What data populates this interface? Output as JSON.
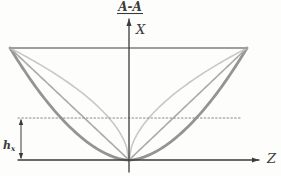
{
  "section_title": "A-A",
  "axis": {
    "vertical_label": "X",
    "horizontal_label": "Z"
  },
  "dimension": {
    "base": "h",
    "subscript": "x"
  },
  "colors": {
    "ink": "#3b3b3b",
    "outer_curve": "#949494",
    "straight_line": "#aaaaaa",
    "inner_curve": "#c8c8c8",
    "top_edge": "#9e9e9e",
    "dotted_line": "#8c8c8c",
    "background": "#fdfdfc"
  },
  "chart_data": {
    "type": "line",
    "origin_px": [
      129,
      160
    ],
    "top_edge_y_px": 48,
    "left_corner_x_px": 10,
    "right_corner_x_px": 247,
    "dotted_level_y_px": 118,
    "dotted_extent_x_px": [
      18,
      240
    ],
    "dimension_line_x_px": 21,
    "x_axis": {
      "x_px": 129,
      "top_y_px": 19,
      "bottom_y_px": 172
    },
    "z_axis": {
      "y_px": 160,
      "left_x_px": 18,
      "right_x_px": 259
    },
    "curves": [
      {
        "name": "outer-profile",
        "shape_exponent": 1.75,
        "color_key": "outer_curve",
        "width": 2.8
      },
      {
        "name": "straight-profile",
        "shape_exponent": 1.0,
        "color_key": "straight_line",
        "width": 1.6
      },
      {
        "name": "inner-profile",
        "shape_exponent": 0.55,
        "color_key": "inner_curve",
        "width": 1.6
      }
    ]
  }
}
